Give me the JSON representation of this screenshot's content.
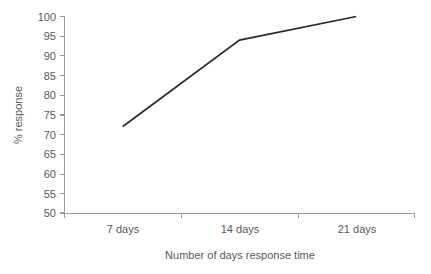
{
  "chart_data": {
    "type": "line",
    "title": "",
    "subtitle": "",
    "xlabel": "Number of days response time",
    "ylabel": "% response",
    "categories": [
      "7 days",
      "14 days",
      "21 days"
    ],
    "series": [
      {
        "name": "% response",
        "values": [
          72,
          94,
          100
        ],
        "color": "#2b2b2b"
      }
    ],
    "ylim": [
      50,
      100
    ],
    "ytick_step": 5,
    "ytick_labels": [
      "100",
      "95",
      "90",
      "85",
      "80",
      "75",
      "70",
      "65",
      "60",
      "55",
      "50"
    ],
    "ytick_values": [
      100,
      95,
      90,
      85,
      80,
      75,
      70,
      65,
      60,
      55,
      50
    ],
    "xtick_labels": [
      "7 days",
      "14 days",
      "21 days"
    ],
    "grid": false,
    "legend": false,
    "legend_position": "none",
    "annotations": [],
    "axis_color": "#9a9a9a",
    "text_color": "#595959",
    "background": "#ffffff"
  },
  "axes": {
    "y_title": "% response",
    "x_title": "Number of days response time"
  }
}
